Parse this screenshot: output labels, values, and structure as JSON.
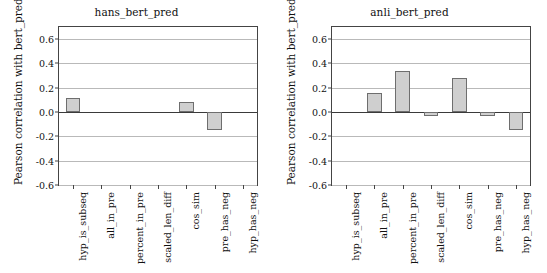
{
  "figure": {
    "width": 547,
    "height": 273,
    "background": "#ffffff",
    "bar_fill": "#cfcfcf",
    "bar_edge": "#6e6e6e",
    "grid_color": "#b9b9b9",
    "axis_color": "#444444"
  },
  "chart_data": [
    {
      "type": "bar",
      "title": "hans_bert_pred",
      "xlabel": "",
      "ylabel": "Pearson correlation with bert_pred",
      "categories": [
        "hyp_is_subseq",
        "all_in_pre",
        "percent_in_pre",
        "scaled_len_diff",
        "cos_sim",
        "pre_has_neg",
        "hyp_has_neg"
      ],
      "values": [
        0.115,
        0.0,
        0.0,
        0.0,
        0.08,
        -0.15,
        0.0
      ],
      "ylim": [
        -0.6,
        0.7
      ],
      "yticks": [
        0.6,
        0.4,
        0.2,
        0.0,
        -0.2,
        -0.4,
        -0.6
      ],
      "ytick_labels": [
        "0.6",
        "0.4",
        "0.2",
        "0.0",
        "-0.2",
        "-0.4",
        "-0.6"
      ],
      "grid": true,
      "legend": false
    },
    {
      "type": "bar",
      "title": "anli_bert_pred",
      "xlabel": "",
      "ylabel": "Pearson correlation with bert_pred",
      "categories": [
        "hyp_is_subseq",
        "all_in_pre",
        "percent_in_pre",
        "scaled_len_diff",
        "cos_sim",
        "pre_has_neg",
        "hyp_has_neg"
      ],
      "values": [
        0.0,
        0.16,
        0.34,
        -0.03,
        0.28,
        -0.03,
        -0.15
      ],
      "ylim": [
        -0.6,
        0.7
      ],
      "yticks": [
        0.6,
        0.4,
        0.2,
        0.0,
        -0.2,
        -0.4,
        -0.6
      ],
      "ytick_labels": [
        "0.6",
        "0.4",
        "0.2",
        "0.0",
        "-0.2",
        "-0.4",
        "-0.6"
      ],
      "grid": true,
      "legend": false
    }
  ]
}
